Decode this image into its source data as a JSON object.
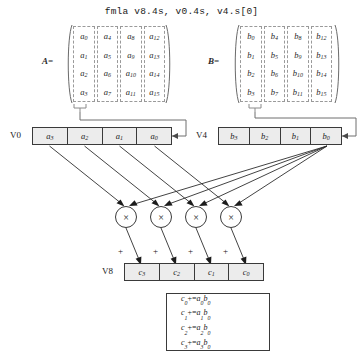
{
  "title": "fmla v8.4s, v0.4s, v4.s[0]",
  "matrices": {
    "a": {
      "label": "A=",
      "columns": [
        [
          "a0",
          "a1",
          "a2",
          "a3"
        ],
        [
          "a4",
          "a5",
          "a6",
          "a7"
        ],
        [
          "a8",
          "a9",
          "a10",
          "a11"
        ],
        [
          "a12",
          "a13",
          "a14",
          "a15"
        ]
      ]
    },
    "b": {
      "label": "B=",
      "columns": [
        [
          "b0",
          "b1",
          "b2",
          "b3"
        ],
        [
          "b4",
          "b5",
          "b6",
          "b7"
        ],
        [
          "b8",
          "b9",
          "b10",
          "b11"
        ],
        [
          "b12",
          "b13",
          "b14",
          "b15"
        ]
      ]
    }
  },
  "registers": {
    "v0": {
      "label": "V0",
      "lanes": [
        "a3",
        "a2",
        "a1",
        "a0"
      ]
    },
    "v4": {
      "label": "V4",
      "lanes": [
        "b3",
        "b2",
        "b1",
        "b0"
      ]
    },
    "v8": {
      "label": "V8",
      "lanes": [
        "c3",
        "c2",
        "c1",
        "c0"
      ]
    }
  },
  "operators": {
    "multiply_symbol": "×",
    "multiply_count": 4,
    "accumulate_symbol": "+",
    "accumulate_count": 4
  },
  "equations": [
    {
      "dst": "c0",
      "op": "+=",
      "lhs": "a0",
      "rhs": "b0"
    },
    {
      "dst": "c1",
      "op": "+=",
      "lhs": "a1",
      "rhs": "b0"
    },
    {
      "dst": "c2",
      "op": "+=",
      "lhs": "a2",
      "rhs": "b0"
    },
    {
      "dst": "c3",
      "op": "+=",
      "lhs": "a3",
      "rhs": "b0"
    }
  ],
  "colors": {
    "register_fill": "#ececec",
    "stroke": "#3a3a3a",
    "dashed_stroke": "#9a9a9a",
    "text": "#1a1a1a"
  }
}
